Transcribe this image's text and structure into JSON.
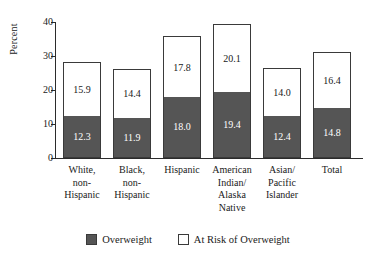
{
  "chart_data": {
    "type": "bar",
    "subtype": "stacked-vertical",
    "title": "",
    "xlabel": "",
    "ylabel": "Percent",
    "ylim": [
      0,
      40
    ],
    "yticks": [
      0,
      10,
      20,
      30,
      40
    ],
    "ytick_labels": [
      "0",
      "10",
      "20",
      "30",
      "40"
    ],
    "grid": false,
    "legend_position": "bottom-center",
    "categories": [
      "White, non-Hispanic",
      "Black, non-Hispanic",
      "Hispanic",
      "American Indian/ Alaska Native",
      "Asian/ Pacific Islander",
      "Total"
    ],
    "category_lines": [
      [
        "White,",
        "non-",
        "Hispanic"
      ],
      [
        "Black,",
        "non-",
        "Hispanic"
      ],
      [
        "Hispanic"
      ],
      [
        "American",
        "Indian/",
        "Alaska",
        "Native"
      ],
      [
        "Asian/",
        "Pacific",
        "Islander"
      ],
      [
        "Total"
      ]
    ],
    "series": [
      {
        "name": "Overweight",
        "color": "#555555",
        "values": [
          12.3,
          11.9,
          18.0,
          19.4,
          12.4,
          14.8
        ],
        "labels": [
          "12.3",
          "11.9",
          "18.0",
          "19.4",
          "12.4",
          "14.8"
        ]
      },
      {
        "name": "At Risk of Overweight",
        "color": "#ffffff",
        "values": [
          15.9,
          14.4,
          17.8,
          20.1,
          14.0,
          16.4
        ],
        "labels": [
          "15.9",
          "14.4",
          "17.8",
          "20.1",
          "14.0",
          "16.4"
        ]
      }
    ],
    "totals": [
      28.2,
      26.3,
      35.8,
      39.5,
      26.4,
      31.2
    ]
  },
  "legend": {
    "entries": [
      {
        "label": "Overweight",
        "swatch": "overweight-swatch"
      },
      {
        "label": "At Risk of Overweight",
        "swatch": "at-risk-swatch"
      }
    ]
  },
  "colors": {
    "overweight": "#555555",
    "at_risk": "#ffffff",
    "outline": "#3a3a3a",
    "axis": "#2b2b2b",
    "text": "#1a1a1a",
    "background": "#ffffff"
  }
}
